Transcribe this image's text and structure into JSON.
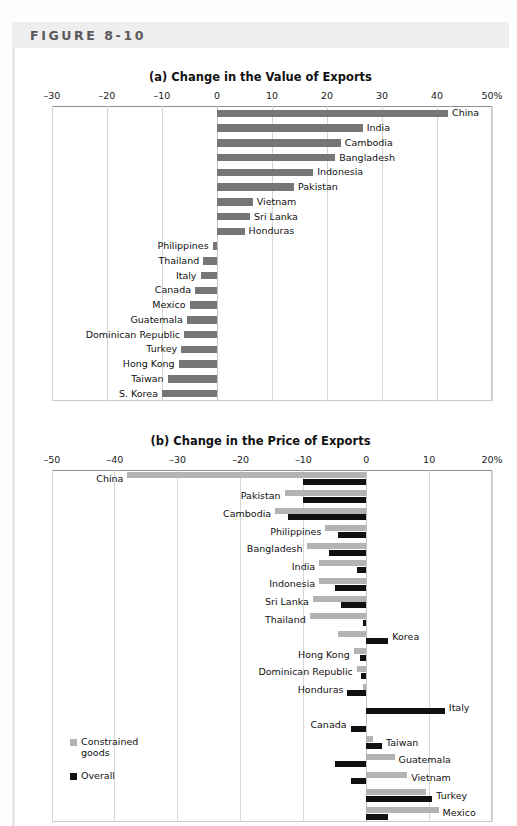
{
  "figure": {
    "label": "FIGURE 8-10"
  },
  "legend": {
    "position": "bottom-left",
    "items": [
      {
        "name": "constrained-goods",
        "label": "Constrained goods",
        "color": "#b3b3b3"
      },
      {
        "name": "overall",
        "label": "Overall",
        "color": "#111111"
      }
    ]
  },
  "chart_data": [
    {
      "type": "bar",
      "orientation": "horizontal",
      "panel": "a",
      "title": "(a) Change in the Value of Exports",
      "xlabel": "",
      "ylabel": "",
      "xlim": [
        -30,
        50
      ],
      "xticks": [
        -30,
        -20,
        -10,
        0,
        10,
        20,
        30,
        40,
        50
      ],
      "xticklabels": [
        "–30",
        "–20",
        "–10",
        "0",
        "10",
        "20",
        "30",
        "40",
        "50%"
      ],
      "grid": true,
      "legend_position": "none",
      "series": [
        {
          "name": "Change in value of exports",
          "color": "#767676"
        }
      ],
      "categories": [
        "China",
        "India",
        "Cambodia",
        "Bangladesh",
        "Indonesia",
        "Pakistan",
        "Vietnam",
        "Sri Lanka",
        "Honduras",
        "Philippines",
        "Thailand",
        "Italy",
        "Canada",
        "Mexico",
        "Guatemala",
        "Dominican Republic",
        "Turkey",
        "Hong Kong",
        "Taiwan",
        "S. Korea"
      ],
      "values": [
        42.0,
        26.5,
        22.5,
        21.5,
        17.5,
        14.0,
        6.5,
        6.0,
        5.0,
        -0.8,
        -2.5,
        -3.0,
        -4.0,
        -5.0,
        -5.5,
        -6.0,
        -6.5,
        -7.0,
        -9.0,
        -10.0
      ]
    },
    {
      "type": "bar",
      "orientation": "horizontal",
      "panel": "b",
      "title": "(b) Change in the Price of Exports",
      "xlabel": "",
      "ylabel": "",
      "xlim": [
        -50,
        20
      ],
      "xticks": [
        -50,
        -40,
        -30,
        -20,
        -10,
        0,
        10,
        20
      ],
      "xticklabels": [
        "–50",
        "–40",
        "–30",
        "–20",
        "–10",
        "0",
        "10",
        "20%"
      ],
      "grid": true,
      "legend_position": "bottom-left",
      "categories": [
        "China",
        "Pakistan",
        "Cambodia",
        "Philippines",
        "Bangladesh",
        "India",
        "Indonesia",
        "Sri Lanka",
        "Thailand",
        "Korea",
        "Hong Kong",
        "Dominican Republic",
        "Honduras",
        "Italy",
        "Canada",
        "Taiwan",
        "Guatemala",
        "Vietnam",
        "Turkey",
        "Mexico"
      ],
      "series": [
        {
          "name": "Constrained goods",
          "color": "#b3b3b3",
          "values": [
            -38.0,
            -13.0,
            -14.5,
            -6.5,
            -9.5,
            -7.5,
            -7.5,
            -8.5,
            -9.0,
            -4.5,
            -2.0,
            -1.5,
            -0.5,
            0.0,
            0.0,
            1.0,
            4.5,
            6.5,
            9.5,
            11.5
          ]
        },
        {
          "name": "Overall",
          "color": "#111111",
          "values": [
            -10.0,
            -10.0,
            -12.5,
            -4.5,
            -6.0,
            -1.5,
            -5.0,
            -4.0,
            -0.5,
            3.5,
            -1.0,
            -0.8,
            -3.0,
            12.5,
            -2.5,
            2.5,
            -5.0,
            -2.5,
            10.5,
            3.5
          ]
        }
      ]
    }
  ]
}
